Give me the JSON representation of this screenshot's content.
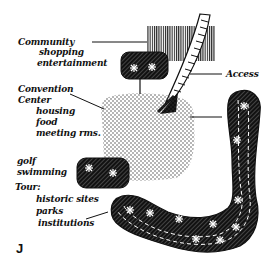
{
  "figure_label": "J",
  "labels": {
    "community": {
      "title": "Community",
      "items": [
        "shopping",
        "entertainment"
      ]
    },
    "convention": {
      "title": "Convention",
      "title2": "Center",
      "items": [
        "housing",
        "food",
        "meeting rms."
      ]
    },
    "access": "Access",
    "recreation": {
      "items": [
        "golf",
        "swimming"
      ]
    },
    "tour": {
      "title": "Tour:",
      "items": [
        "historic sites",
        "parks",
        "institutions"
      ]
    }
  },
  "colors": {
    "ink": "#111111",
    "paper": "#ffffff",
    "dots": "#333333",
    "star": "#ffffff"
  }
}
